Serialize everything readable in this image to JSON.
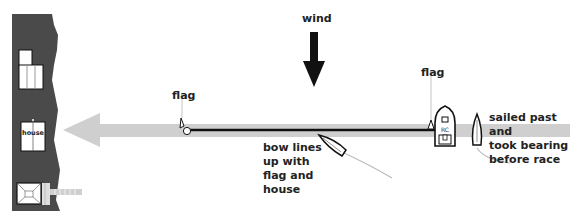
{
  "diagram": {
    "labels": {
      "wind": "wind",
      "flag_left": "flag",
      "flag_right": "flag",
      "house": "house",
      "committee_boat": "RC",
      "bow_note": [
        "bow lines",
        "up with",
        "flag and",
        "house"
      ],
      "bearing_note": [
        "sailed past and",
        "took bearing",
        "before race"
      ]
    },
    "colors": {
      "shore": "#4a4a4a",
      "transit_arrow": "#cfcfcf",
      "start_line": "#111111",
      "wake": "#bbbbbb",
      "background": "#ffffff"
    }
  }
}
